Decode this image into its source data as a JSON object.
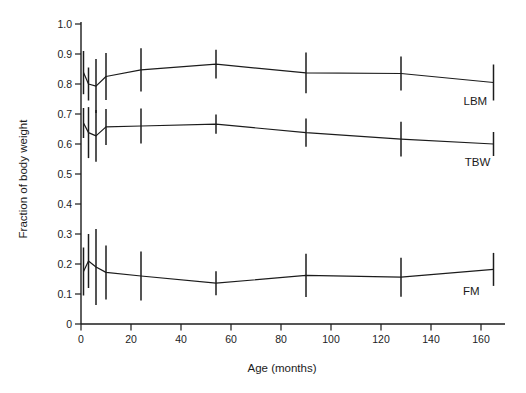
{
  "figure": {
    "background": "#ffffff",
    "line_color": "#1c1c1c",
    "text_color": "#1c1c1c"
  },
  "chart_data": {
    "type": "line",
    "title": "",
    "xlabel": "Age (months)",
    "ylabel": "Fraction of body weight",
    "xlim": [
      0,
      169.6
    ],
    "ylim": [
      0,
      1.0
    ],
    "grid": false,
    "error_bars": true,
    "error_bar_caps": false,
    "legend_position": "inline-labels-near-last-points",
    "x_tick_values": [
      0,
      20,
      40,
      60,
      80,
      100,
      120,
      140,
      160
    ],
    "x_tick_labels": [
      "0",
      "20",
      "40",
      "60",
      "80",
      "100",
      "120",
      "140",
      "160"
    ],
    "y_tick_values": [
      0,
      0.1,
      0.2,
      0.3,
      0.4,
      0.5,
      0.6,
      0.7,
      0.8,
      0.9,
      1.0
    ],
    "y_tick_labels": [
      "0",
      "0.1",
      "0.2",
      "0.3",
      "0.4",
      "0.5",
      "0.6",
      "0.7",
      "0.8",
      "0.9",
      "1.0"
    ],
    "x": [
      1,
      3,
      6,
      10,
      24,
      54,
      90,
      128,
      165
    ],
    "series": [
      {
        "name": "LBM",
        "values": [
          0.838,
          0.8,
          0.793,
          0.825,
          0.847,
          0.866,
          0.837,
          0.835,
          0.805
        ],
        "errors": [
          0.072,
          0.055,
          0.09,
          0.078,
          0.072,
          0.048,
          0.068,
          0.057,
          0.06
        ],
        "label": {
          "x": 153,
          "y": 0.73
        }
      },
      {
        "name": "TBW",
        "values": [
          0.67,
          0.638,
          0.627,
          0.657,
          0.66,
          0.666,
          0.638,
          0.616,
          0.6
        ],
        "errors": [
          0.05,
          0.085,
          0.086,
          0.06,
          0.058,
          0.032,
          0.047,
          0.058,
          0.04
        ],
        "label": {
          "x": 153.5,
          "y": 0.528
        }
      },
      {
        "name": "FM",
        "values": [
          0.175,
          0.21,
          0.19,
          0.172,
          0.16,
          0.136,
          0.162,
          0.156,
          0.182
        ],
        "errors": [
          0.08,
          0.09,
          0.127,
          0.09,
          0.082,
          0.04,
          0.072,
          0.065,
          0.055
        ],
        "label": {
          "x": 152.8,
          "y": 0.096
        }
      }
    ]
  }
}
